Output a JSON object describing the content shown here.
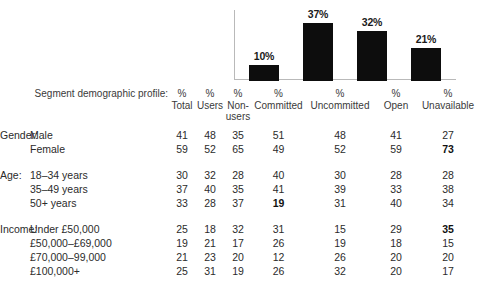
{
  "chart_data": {
    "type": "bar",
    "title": "",
    "xlabel": "",
    "ylabel": "",
    "grid": false,
    "legend": false,
    "ylim": [
      0,
      45
    ],
    "categories": [
      "Committed",
      "Uncommitted",
      "Open",
      "Unavailable"
    ],
    "values": [
      10,
      37,
      32,
      21
    ],
    "labels": [
      "10%",
      "37%",
      "32%",
      "21%"
    ],
    "bar_color": "#0d0d0d",
    "axis_color": "#b9b9b9"
  },
  "table": {
    "profile_label": "Segment demographic profile:",
    "headers": [
      {
        "pct": "%",
        "name": "Total"
      },
      {
        "pct": "%",
        "name": "Users"
      },
      {
        "pct": "%",
        "name": "Non-users"
      },
      {
        "pct": "%",
        "name": "Committed"
      },
      {
        "pct": "%",
        "name": "Uncommitted"
      },
      {
        "pct": "%",
        "name": "Open"
      },
      {
        "pct": "%",
        "name": "Unavailable"
      }
    ],
    "groups": [
      {
        "label": "Gender:",
        "rows": [
          {
            "category": "Male",
            "values": [
              "41",
              "48",
              "35",
              "51",
              "48",
              "41",
              "27"
            ],
            "bold": [
              false,
              false,
              false,
              false,
              false,
              false,
              false
            ]
          },
          {
            "category": "Female",
            "values": [
              "59",
              "52",
              "65",
              "49",
              "52",
              "59",
              "73"
            ],
            "bold": [
              false,
              false,
              false,
              false,
              false,
              false,
              true
            ]
          }
        ]
      },
      {
        "label": "Age:",
        "rows": [
          {
            "category": "18–34 years",
            "values": [
              "30",
              "32",
              "28",
              "40",
              "30",
              "28",
              "28"
            ],
            "bold": [
              false,
              false,
              false,
              false,
              false,
              false,
              false
            ]
          },
          {
            "category": "35–49 years",
            "values": [
              "37",
              "40",
              "35",
              "41",
              "39",
              "33",
              "38"
            ],
            "bold": [
              false,
              false,
              false,
              false,
              false,
              false,
              false
            ]
          },
          {
            "category": "50+ years",
            "values": [
              "33",
              "28",
              "37",
              "19",
              "31",
              "40",
              "34"
            ],
            "bold": [
              false,
              false,
              false,
              true,
              false,
              false,
              false
            ]
          }
        ]
      },
      {
        "label": "Income:",
        "rows": [
          {
            "category": "Under £50,000",
            "values": [
              "25",
              "18",
              "32",
              "31",
              "15",
              "29",
              "35"
            ],
            "bold": [
              false,
              false,
              false,
              false,
              false,
              false,
              true
            ]
          },
          {
            "category": "£50,000–£69,000",
            "values": [
              "19",
              "21",
              "17",
              "26",
              "19",
              "18",
              "15"
            ],
            "bold": [
              false,
              false,
              false,
              false,
              false,
              false,
              false
            ]
          },
          {
            "category": "£70,000–99,000",
            "values": [
              "21",
              "23",
              "20",
              "12",
              "26",
              "20",
              "20"
            ],
            "bold": [
              false,
              false,
              false,
              false,
              false,
              false,
              false
            ]
          },
          {
            "category": "£100,000+",
            "values": [
              "25",
              "31",
              "19",
              "26",
              "32",
              "20",
              "17"
            ],
            "bold": [
              false,
              false,
              false,
              false,
              false,
              false,
              false
            ]
          }
        ]
      }
    ]
  }
}
